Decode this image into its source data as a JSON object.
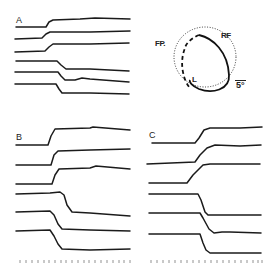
{
  "figure": {
    "panels": [
      {
        "id": "A",
        "label": "A",
        "trace_count": 6,
        "directions": [
          "up",
          "up",
          "up",
          "down",
          "down",
          "down"
        ]
      },
      {
        "id": "B",
        "label": "B",
        "trace_count": 6,
        "directions": [
          "up",
          "up",
          "up",
          "down",
          "down",
          "down"
        ]
      },
      {
        "id": "C",
        "label": "C",
        "trace_count": 6,
        "directions": [
          "up",
          "up",
          "up",
          "down",
          "down",
          "down"
        ]
      }
    ],
    "diagram": {
      "fixation_point_label": "FP.",
      "receptive_field_label": "RF",
      "stimulus_path_label": "L",
      "scale_bar_label": "5°"
    },
    "time_marker": {
      "ticks_per_panel": 22
    }
  }
}
